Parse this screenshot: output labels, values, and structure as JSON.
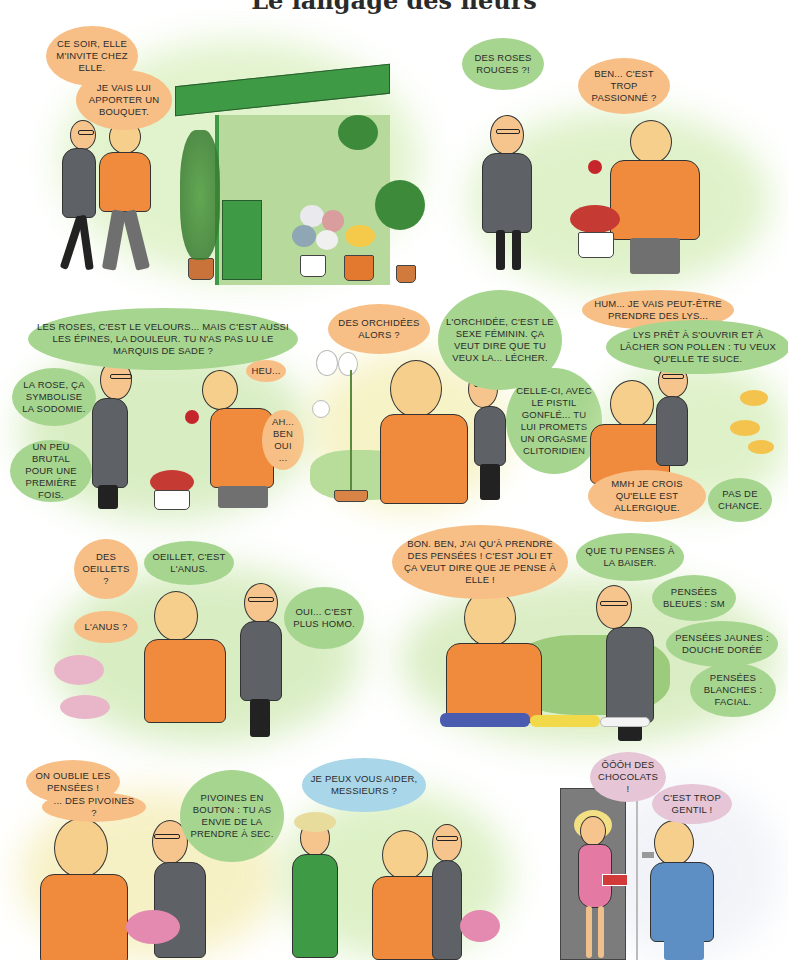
{
  "page": {
    "title": "Le langage des fleurs"
  },
  "panels": [
    {
      "id": 1,
      "scene": "shop-front",
      "bubbles": [
        {
          "speaker": "bald-man",
          "color": "orange",
          "text": "CE SOIR, ELLE M'INVITE CHEZ ELLE."
        },
        {
          "speaker": "bald-man",
          "color": "orange",
          "text": "JE VAIS LUI APPORTER UN BOUQUET."
        }
      ]
    },
    {
      "id": 2,
      "scene": "red-roses",
      "bubbles": [
        {
          "speaker": "glasses-man",
          "color": "green",
          "text": "DES ROSES ROUGES ?!"
        },
        {
          "speaker": "bald-man",
          "color": "orange",
          "text": "BEN... C'EST TROP PASSIONNÉ ?"
        }
      ]
    },
    {
      "id": 3,
      "scene": "roses",
      "bubbles": [
        {
          "speaker": "glasses-man",
          "color": "green",
          "text": "LES ROSES, C'EST LE VELOURS... MAIS C'EST AUSSI LES ÉPINES, LA DOULEUR. TU N'AS PAS LU LE MARQUIS DE SADE ?"
        },
        {
          "speaker": "bald-man",
          "color": "orange",
          "text": "HEU..."
        },
        {
          "speaker": "glasses-man",
          "color": "green",
          "text": "LA ROSE, ÇA SYMBOLISE LA SODOMIE."
        },
        {
          "speaker": "bald-man",
          "color": "orange",
          "text": "AH... BEN OUI ..."
        },
        {
          "speaker": "glasses-man",
          "color": "green",
          "text": "UN PEU BRUTAL POUR UNE PREMIÈRE FOIS."
        }
      ]
    },
    {
      "id": 4,
      "scene": "orchids",
      "bubbles": [
        {
          "speaker": "bald-man",
          "color": "orange",
          "text": "DES ORCHIDÉES ALORS ?"
        },
        {
          "speaker": "glasses-man",
          "color": "green",
          "text": "L'ORCHIDÉE, C'EST LE SEXE FÉMININ. ÇA VEUT DIRE QUE TU VEUX LA... LÉCHER."
        },
        {
          "speaker": "glasses-man",
          "color": "green",
          "text": "CELLE-CI, AVEC LE PISTIL GONFLÉ... TU LUI PROMETS UN ORGASME CLITORIDIEN"
        }
      ]
    },
    {
      "id": 5,
      "scene": "lilies",
      "bubbles": [
        {
          "speaker": "bald-man",
          "color": "orange",
          "text": "HUM... JE VAIS PEUT-ÊTRE PRENDRE DES LYS..."
        },
        {
          "speaker": "glasses-man",
          "color": "green",
          "text": "LYS PRÊT À S'OUVRIR ET À LÂCHER SON POLLEN : TU VEUX QU'ELLE TE SUCE."
        },
        {
          "speaker": "bald-man",
          "color": "orange",
          "text": "MMH JE CROIS QU'ELLE EST ALLERGIQUE."
        },
        {
          "speaker": "glasses-man",
          "color": "green",
          "text": "PAS DE CHANCE."
        }
      ]
    },
    {
      "id": 6,
      "scene": "carnations",
      "bubbles": [
        {
          "speaker": "bald-man",
          "color": "orange",
          "text": "DES OEILLETS ?"
        },
        {
          "speaker": "glasses-man",
          "color": "green",
          "text": "OEILLET, C'EST L'ANUS."
        },
        {
          "speaker": "bald-man",
          "color": "orange",
          "text": "L'ANUS ?"
        },
        {
          "speaker": "glasses-man",
          "color": "green",
          "text": "OUI... C'EST PLUS HOMO."
        }
      ]
    },
    {
      "id": 7,
      "scene": "pansies",
      "bubbles": [
        {
          "speaker": "bald-man",
          "color": "orange",
          "text": "BON. BEN, J'AI QU'À PRENDRE DES PENSÉES ! C'EST JOLI ET ÇA VEUT DIRE QUE JE PENSE À ELLE !"
        },
        {
          "speaker": "glasses-man",
          "color": "green",
          "text": "QUE TU PENSES À LA BAISER."
        },
        {
          "speaker": "glasses-man",
          "color": "green",
          "text": "PENSÉES BLEUES : SM"
        },
        {
          "speaker": "glasses-man",
          "color": "green",
          "text": "PENSÉES JAUNES : DOUCHE DORÉE"
        },
        {
          "speaker": "glasses-man",
          "color": "green",
          "text": "PENSÉES BLANCHES : FACIAL."
        }
      ]
    },
    {
      "id": 8,
      "scene": "peonies",
      "bubbles": [
        {
          "speaker": "bald-man",
          "color": "orange",
          "text": "ON OUBLIE LES PENSÉES !"
        },
        {
          "speaker": "bald-man",
          "color": "orange",
          "text": "... DES PIVOINES ?"
        },
        {
          "speaker": "glasses-man",
          "color": "green",
          "text": "PIVOINES EN BOUTON : TU AS ENVIE DE LA PRENDRE À SEC."
        }
      ]
    },
    {
      "id": 9,
      "scene": "florist",
      "bubbles": [
        {
          "speaker": "florist",
          "color": "blue",
          "text": "JE PEUX VOUS AIDER, MESSIEURS ?"
        }
      ]
    },
    {
      "id": 10,
      "scene": "doorstep",
      "bubbles": [
        {
          "speaker": "woman",
          "color": "pink",
          "text": "ÔÔÔH DES CHOCOLATS !"
        },
        {
          "speaker": "bald-man",
          "color": "pink",
          "text": "C'EST TROP GENTIL !"
        }
      ]
    }
  ],
  "colors": {
    "orange_bubble": "#f7bf85",
    "green_bubble": "#a6d58f",
    "blue_bubble": "#a9d6e8",
    "pink_bubble": "#e5c5d6",
    "sweater": "#f08a3c",
    "awning": "#3f9a46",
    "background_wash_green": "#cfe9b4",
    "background_wash_yellow": "#f7f2b8"
  }
}
